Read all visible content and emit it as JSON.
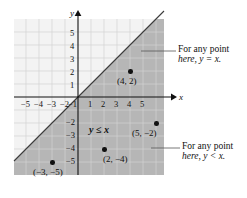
{
  "figure": {
    "type": "cartesian-inequality-graph",
    "axis_labels": {
      "x": "x",
      "y": "y"
    },
    "x_ticks": [
      "−5",
      "−4",
      "−3",
      "−2",
      "−1",
      "1",
      "2",
      "3",
      "4",
      "5"
    ],
    "y_ticks_positive": [
      "5",
      "4",
      "3",
      "2",
      "1"
    ],
    "y_ticks_negative": [
      "−2",
      "−3",
      "−4",
      "−5"
    ],
    "inequality_label": "y ≤ x",
    "points": [
      {
        "label": "(4, 2)",
        "x": 4,
        "y": 2
      },
      {
        "label": "(5, −2)",
        "x": 5,
        "y": -2
      },
      {
        "label": "(2, −4)",
        "x": 2,
        "y": -4
      },
      {
        "label": "(−3, −5)",
        "x": -3,
        "y": -5
      }
    ],
    "annotations": [
      {
        "line1": "For any point",
        "line2": "here, y = x."
      },
      {
        "line1": "For any point",
        "line2": "here, y < x."
      }
    ],
    "colors": {
      "shading": "#b4b4b4",
      "grid": "#cfcfcf",
      "axis": "#111111",
      "boundary_line": "#333333",
      "plot_background": "#f2f2f2"
    }
  }
}
